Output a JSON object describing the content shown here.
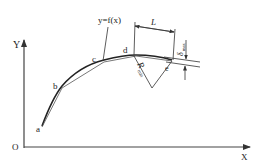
{
  "diagram": {
    "axes": {
      "x_label": "X",
      "y_label": "Y",
      "origin_label": "O"
    },
    "curve": {
      "function_label": "y=f(x)",
      "points": [
        {
          "label": "a"
        },
        {
          "label": "b"
        },
        {
          "label": "c"
        },
        {
          "label": "d"
        },
        {
          "label": "e"
        }
      ]
    },
    "dimensions": {
      "length_label": "L",
      "radius_label": "R",
      "radius_subscript": "min",
      "deviation_label": "δ",
      "deviation_subscript": "max"
    },
    "colors": {
      "line": "#333333",
      "background": "#ffffff"
    }
  }
}
